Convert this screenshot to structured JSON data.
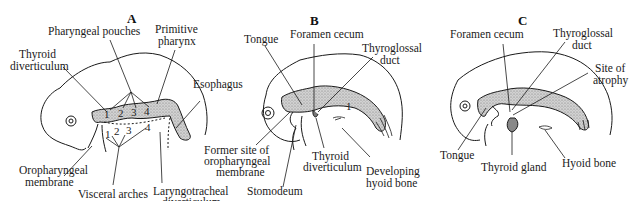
{
  "figure": {
    "colors": {
      "line": "#1a1a1a",
      "stipple": "#b8b8b8",
      "background": "#ffffff"
    },
    "panels": [
      {
        "letter": "A",
        "labels": {
          "pharyngeal_pouches": "Pharyngeal pouches",
          "primitive_pharynx_1": "Primitive",
          "primitive_pharynx_2": "pharynx",
          "thyroid_div_1": "Thyroid",
          "thyroid_div_2": "diverticulum",
          "esophagus": "Esophagus",
          "oropharyngeal_1": "Oropharyngeal",
          "oropharyngeal_2": "membrane",
          "visceral_arches": "Visceral arches",
          "laryngotracheal_1": "Laryngotracheal",
          "laryngotracheal_2": "diverticulum"
        },
        "pouch_numbers": [
          "1",
          "2",
          "3",
          "4"
        ],
        "arch_numbers": [
          "1",
          "2",
          "3",
          "4"
        ]
      },
      {
        "letter": "B",
        "labels": {
          "tongue": "Tongue",
          "foramen_cecum": "Foramen cecum",
          "thyroglossal_1": "Thyroglossal",
          "thyroglossal_2": "duct",
          "former_site_1": "Former site of",
          "former_site_2": "oropharyngeal",
          "former_site_3": "membrane",
          "stomodeum": "Stomodeum",
          "thyroid_div_1": "Thyroid",
          "thyroid_div_2": "diverticulum",
          "hyoid_1": "Developing",
          "hyoid_2": "hyoid bone"
        },
        "pouch_numbers": [
          "1"
        ]
      },
      {
        "letter": "C",
        "labels": {
          "foramen_cecum": "Foramen cecum",
          "thyroglossal_1": "Thyroglossal",
          "thyroglossal_2": "duct",
          "atrophy_1": "Site of",
          "atrophy_2": "atrophy",
          "tongue": "Tongue",
          "thyroid_gland": "Thyroid gland",
          "hyoid_bone": "Hyoid bone"
        }
      }
    ]
  }
}
